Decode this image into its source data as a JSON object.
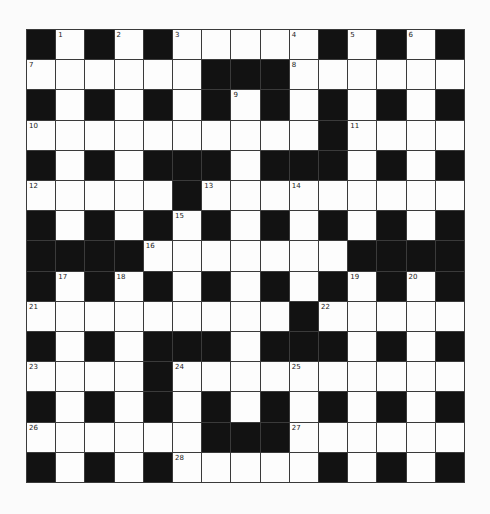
{
  "puzzle": {
    "rows": 15,
    "cols": 15,
    "colors": {
      "block": "#121212",
      "open": "#fdfdfd",
      "line": "#3a3a3a",
      "background": "#fbfbfb"
    },
    "layout": [
      "#.#.#....#.#.#",
      "",
      "",
      "",
      "",
      "",
      "",
      "",
      "",
      "",
      "",
      "",
      "",
      "",
      ""
    ],
    "grid": [
      "#.#.#.....#.#.#",
      "......###......",
      "#.#.#.#.#.#.#.#",
      "..........#....",
      "#.#.###.###.#.#",
      ".....#.........",
      "#.#.#.#.#.#.#.#",
      "####.......####",
      "#.#.#.#.#.#.#.#",
      ".........#.....",
      "#.#.###.###.#.#",
      "....#..........",
      "#.#.#.#.#.#.#.#",
      "......###......",
      "#.#.#.....#.#.#"
    ],
    "numbers": [
      {
        "row": 0,
        "col": 1,
        "n": "1"
      },
      {
        "row": 0,
        "col": 3,
        "n": "2"
      },
      {
        "row": 0,
        "col": 5,
        "n": "3"
      },
      {
        "row": 0,
        "col": 9,
        "n": "4"
      },
      {
        "row": 0,
        "col": 11,
        "n": "5"
      },
      {
        "row": 0,
        "col": 13,
        "n": "6"
      },
      {
        "row": 1,
        "col": 0,
        "n": "7"
      },
      {
        "row": 1,
        "col": 9,
        "n": "8"
      },
      {
        "row": 2,
        "col": 7,
        "n": "9"
      },
      {
        "row": 3,
        "col": 0,
        "n": "10"
      },
      {
        "row": 3,
        "col": 11,
        "n": "11"
      },
      {
        "row": 5,
        "col": 0,
        "n": "12"
      },
      {
        "row": 5,
        "col": 6,
        "n": "13"
      },
      {
        "row": 5,
        "col": 9,
        "n": "14"
      },
      {
        "row": 6,
        "col": 5,
        "n": "15"
      },
      {
        "row": 7,
        "col": 4,
        "n": "16"
      },
      {
        "row": 8,
        "col": 1,
        "n": "17"
      },
      {
        "row": 8,
        "col": 3,
        "n": "18"
      },
      {
        "row": 8,
        "col": 11,
        "n": "19"
      },
      {
        "row": 8,
        "col": 13,
        "n": "20"
      },
      {
        "row": 9,
        "col": 0,
        "n": "21"
      },
      {
        "row": 9,
        "col": 10,
        "n": "22"
      },
      {
        "row": 11,
        "col": 0,
        "n": "23"
      },
      {
        "row": 11,
        "col": 5,
        "n": "24"
      },
      {
        "row": 11,
        "col": 9,
        "n": "25"
      },
      {
        "row": 13,
        "col": 0,
        "n": "26"
      },
      {
        "row": 13,
        "col": 9,
        "n": "27"
      },
      {
        "row": 14,
        "col": 5,
        "n": "28"
      }
    ]
  }
}
